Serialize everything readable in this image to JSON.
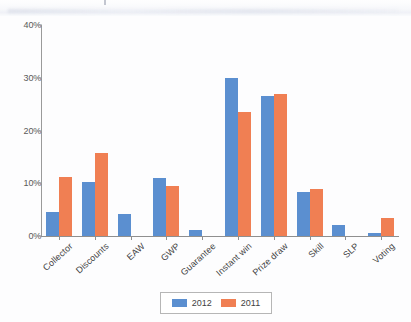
{
  "figure": {
    "background_color": "#fdfdfe",
    "has_scan_artifact": true
  },
  "legend": {
    "position": "bottom-center",
    "entries": [
      {
        "label": "2012",
        "color": "#5B8FD0"
      },
      {
        "label": "2011",
        "color": "#F07F53"
      }
    ]
  },
  "axis": {
    "y_ticks": [
      "0%",
      "10%",
      "20%",
      "30%",
      "40%"
    ],
    "y_tick_values": [
      0,
      10,
      20,
      30,
      40
    ]
  },
  "chart_data": {
    "type": "bar",
    "title": "",
    "subtitle": "",
    "xlabel": "",
    "ylabel": "",
    "ylim": [
      0,
      40
    ],
    "ytick_labels": [
      "0%",
      "10%",
      "20%",
      "30%",
      "40%"
    ],
    "grid": false,
    "legend_position": "bottom-center",
    "categories": [
      "Collector",
      "Discounts",
      "EAW",
      "GWP",
      "Guarantee",
      "Instant win",
      "Prize draw",
      "Skill",
      "SLP",
      "Voting"
    ],
    "series": [
      {
        "name": "2012",
        "color": "#5B8FD0",
        "values": [
          4.6,
          10.3,
          4.1,
          11.0,
          1.2,
          30.0,
          26.5,
          8.3,
          2.0,
          0.6
        ]
      },
      {
        "name": "2011",
        "color": "#F07F53",
        "values": [
          11.2,
          15.8,
          0,
          9.5,
          0,
          23.6,
          27.0,
          8.9,
          0,
          3.5
        ]
      }
    ]
  }
}
